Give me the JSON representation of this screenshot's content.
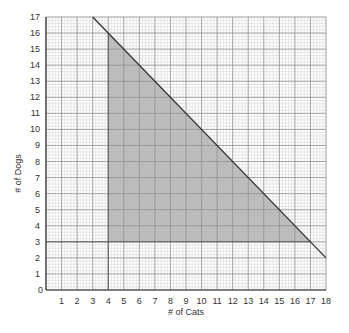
{
  "chart_data": {
    "type": "area",
    "title": "",
    "xlabel": "# of Cats",
    "ylabel": "# of Dogs",
    "xlim": [
      0,
      18
    ],
    "ylim": [
      0,
      17
    ],
    "x_ticks": [
      1,
      2,
      3,
      4,
      5,
      6,
      7,
      8,
      9,
      10,
      11,
      12,
      13,
      14,
      15,
      16,
      17,
      18
    ],
    "y_ticks": [
      1,
      2,
      3,
      4,
      5,
      6,
      7,
      8,
      9,
      10,
      11,
      12,
      13,
      14,
      15,
      16,
      17
    ],
    "origin_label": "0",
    "grid": {
      "major": true,
      "minor_per_unit": 5
    },
    "boundary_line": {
      "equation": "x + y = 20",
      "from": [
        3,
        17
      ],
      "to": [
        18,
        2
      ]
    },
    "vertical_line": {
      "x": 4,
      "from_y": 0,
      "to_y": 16
    },
    "horizontal_line": {
      "y": 3,
      "from_x": 0,
      "to_x": 17
    },
    "shaded_region": {
      "constraints": [
        "x >= 4",
        "y >= 3",
        "x + y <= 20"
      ],
      "vertices": [
        [
          4,
          3
        ],
        [
          4,
          16
        ],
        [
          17,
          3
        ]
      ],
      "color": "#b3b3b3"
    },
    "legend": null
  },
  "colors": {
    "grid_minor": "#d9d9d9",
    "grid_major": "#8a8a8a",
    "line": "#333333",
    "shade": "#b3b3b3"
  }
}
